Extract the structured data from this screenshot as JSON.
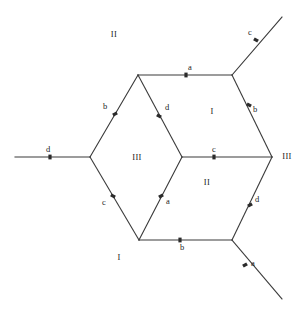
{
  "figure": {
    "title": "",
    "background": "#ffffff",
    "stroke_color": "#3a3a3a",
    "text_color": "#1c1c1c",
    "width": 308,
    "height": 316
  },
  "vertices": [
    {
      "id": "V_left",
      "x": 90,
      "y": 157
    },
    {
      "id": "V_top_left",
      "x": 138,
      "y": 75
    },
    {
      "id": "V_top_right",
      "x": 232,
      "y": 75
    },
    {
      "id": "V_right",
      "x": 272,
      "y": 157
    },
    {
      "id": "V_bottom_right",
      "x": 232,
      "y": 240
    },
    {
      "id": "V_bottom_left",
      "x": 139,
      "y": 240
    },
    {
      "id": "V_center",
      "x": 182,
      "y": 157
    }
  ],
  "edges": [
    {
      "id": "e_top",
      "from": "V_top_left",
      "to": "V_top_right",
      "label": "a",
      "label_x": 190,
      "label_y": 68,
      "tick_x": 186,
      "tick_y": 75,
      "tick_angle": 0
    },
    {
      "id": "e_upper_left",
      "from": "V_top_left",
      "to": "V_left",
      "label": "b",
      "label_x": 105,
      "label_y": 107,
      "tick_x": 115,
      "tick_y": 114,
      "tick_angle": 60
    },
    {
      "id": "e_diag_center_up",
      "from": "V_center",
      "to": "V_top_left",
      "label": "d",
      "label_x": 167,
      "label_y": 108,
      "tick_x": 159,
      "tick_y": 116,
      "tick_angle": -60
    },
    {
      "id": "e_upper_right",
      "from": "V_top_right",
      "to": "V_right",
      "label": "b",
      "label_x": 255,
      "label_y": 110,
      "tick_x": 249,
      "tick_y": 105,
      "tick_angle": -60
    },
    {
      "id": "e_center_right",
      "from": "V_center",
      "to": "V_right",
      "label": "c",
      "label_x": 214,
      "label_y": 150,
      "tick_x": 214,
      "tick_y": 157,
      "tick_angle": 0
    },
    {
      "id": "e_lower_left",
      "from": "V_left",
      "to": "V_bottom_left",
      "label": "c",
      "label_x": 104,
      "label_y": 203,
      "tick_x": 113,
      "tick_y": 196,
      "tick_angle": -60
    },
    {
      "id": "e_diag_center_dn",
      "from": "V_bottom_left",
      "to": "V_center",
      "label": "a",
      "label_x": 168,
      "label_y": 202,
      "tick_x": 161,
      "tick_y": 196,
      "tick_angle": 60
    },
    {
      "id": "e_bottom",
      "from": "V_bottom_left",
      "to": "V_bottom_right",
      "label": "b",
      "label_x": 182,
      "label_y": 248,
      "tick_x": 180,
      "tick_y": 240,
      "tick_angle": 0
    },
    {
      "id": "e_lower_right",
      "from": "V_right",
      "to": "V_bottom_right",
      "label": "d",
      "label_x": 257,
      "label_y": 200,
      "tick_x": 250,
      "tick_y": 205,
      "tick_angle": 60
    }
  ],
  "rays": [
    {
      "id": "ray_left",
      "from": "V_left",
      "x2": 15,
      "y2": 157,
      "label": "d",
      "label_x": 48,
      "label_y": 150,
      "tick_x": 50,
      "tick_y": 157,
      "tick_angle": 0
    },
    {
      "id": "ray_top_right",
      "from": "V_top_right",
      "x2": 282,
      "y2": 17,
      "label": "c",
      "label_x": 250,
      "label_y": 33,
      "tick_x": 256,
      "tick_y": 40,
      "tick_angle": -59
    },
    {
      "id": "ray_bottom_right",
      "from": "V_bottom_right",
      "x2": 282,
      "y2": 299,
      "label": "a",
      "label_x": 253,
      "label_y": 264,
      "tick_x": 245,
      "tick_y": 265,
      "tick_angle": 59
    }
  ],
  "face_labels": [
    {
      "id": "face_outer_top",
      "text": "II",
      "x": 114,
      "y": 35
    },
    {
      "id": "face_inner_upper",
      "text": "I",
      "x": 212,
      "y": 112
    },
    {
      "id": "face_inner_left",
      "text": "III",
      "x": 137,
      "y": 158
    },
    {
      "id": "face_inner_lower",
      "text": "II",
      "x": 207,
      "y": 183
    },
    {
      "id": "face_outer_right",
      "text": "III",
      "x": 287,
      "y": 157
    },
    {
      "id": "face_outer_bottom",
      "text": "I",
      "x": 119,
      "y": 258
    }
  ]
}
